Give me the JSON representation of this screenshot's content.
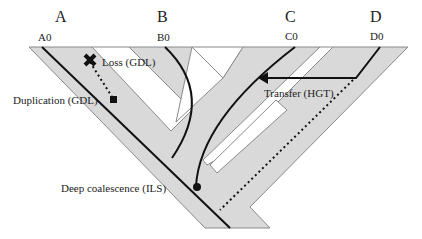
{
  "species": [
    {
      "label": "A",
      "gene": "A0"
    },
    {
      "label": "B",
      "gene": "B0"
    },
    {
      "label": "C",
      "gene": "C0"
    },
    {
      "label": "D",
      "gene": "D0"
    }
  ],
  "events": {
    "loss": "Loss (GDL)",
    "duplication": "Duplication (GDL)",
    "transfer": "Transfer (HGT)",
    "deep_coalescence": "Deep coalescence (ILS)"
  },
  "colors": {
    "species_tree_fill": "#d9d9d9",
    "species_tree_stroke": "#8a8a8a",
    "gene_tree": "#111111"
  }
}
